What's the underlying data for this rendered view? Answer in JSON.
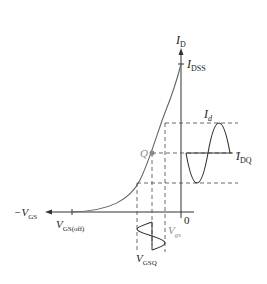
{
  "diagram": {
    "labels": {
      "id_axis": "I",
      "id_axis_sub": "D",
      "idss": "I",
      "idss_sub": "DSS",
      "id_signal": "I",
      "id_signal_sub": "d",
      "idq": "I",
      "idq_sub": "DQ",
      "q_point": "Q",
      "neg_vgs": "−V",
      "neg_vgs_sub": "GS",
      "vgs_off": "V",
      "vgs_off_sub": "GS(off)",
      "origin": "0",
      "vgs_signal": "V",
      "vgs_signal_sub": "gs",
      "vgsq": "V",
      "vgsq_sub": "GSQ"
    },
    "colors": {
      "line": "#333333",
      "curve": "#666666",
      "q_point": "#888888",
      "dashed": "#444444"
    }
  }
}
